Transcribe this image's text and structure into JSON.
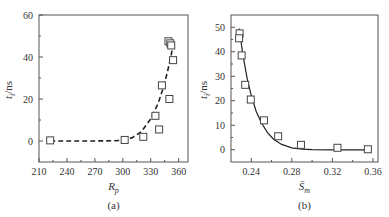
{
  "chart_data": [
    {
      "type": "scatter",
      "panel_label": "(a)",
      "xlabel": "R",
      "xlabel_sub": "p",
      "ylabel": "t",
      "ylabel_sub": "i",
      "ylabel_unit": "/ns",
      "xlim": [
        210,
        370
      ],
      "ylim": [
        -10,
        60
      ],
      "xticks": [
        210,
        240,
        270,
        300,
        330,
        360
      ],
      "yticks": [
        0,
        20,
        40,
        60
      ],
      "grid": false,
      "series": [
        {
          "name": "measured",
          "marker": "open-square",
          "points": [
            [
              222,
              0.3
            ],
            [
              302,
              0.5
            ],
            [
              322,
              2
            ],
            [
              335,
              12
            ],
            [
              339,
              5.5
            ],
            [
              342,
              26.5
            ],
            [
              349,
              47.5
            ],
            [
              350,
              20
            ],
            [
              351,
              46.5
            ],
            [
              352,
              45.5
            ],
            [
              354,
              38.5
            ]
          ]
        },
        {
          "name": "fit",
          "style": "dashed",
          "points": [
            [
              222,
              0
            ],
            [
              260,
              0
            ],
            [
              290,
              0.1
            ],
            [
              300,
              0.4
            ],
            [
              310,
              1.5
            ],
            [
              320,
              4.5
            ],
            [
              330,
              10.5
            ],
            [
              338,
              18
            ],
            [
              344,
              26
            ],
            [
              348,
              33
            ],
            [
              352,
              41
            ],
            [
              354,
              46
            ]
          ]
        }
      ]
    },
    {
      "type": "scatter",
      "panel_label": "(b)",
      "xlabel": "S̄",
      "xlabel_sub": "m",
      "ylabel": "t",
      "ylabel_sub": "i",
      "ylabel_unit": "/ns",
      "xlim": [
        0.22,
        0.365
      ],
      "ylim": [
        -5,
        55
      ],
      "xticks": [
        0.24,
        0.28,
        0.32,
        0.36
      ],
      "yticks": [
        0,
        10,
        20,
        30,
        40,
        50
      ],
      "grid": false,
      "series": [
        {
          "name": "measured",
          "marker": "open-square",
          "points": [
            [
              0.2285,
              47.5
            ],
            [
              0.228,
              45.5
            ],
            [
              0.2305,
              38.5
            ],
            [
              0.234,
              26.5
            ],
            [
              0.2395,
              20.5
            ],
            [
              0.2525,
              12
            ],
            [
              0.2665,
              5.5
            ],
            [
              0.289,
              2
            ],
            [
              0.325,
              0.8
            ],
            [
              0.355,
              0.2
            ]
          ]
        },
        {
          "name": "fit",
          "style": "solid",
          "points": [
            [
              0.228,
              49.5
            ],
            [
              0.232,
              38
            ],
            [
              0.236,
              29
            ],
            [
              0.24,
              22
            ],
            [
              0.245,
              15.5
            ],
            [
              0.25,
              11
            ],
            [
              0.256,
              7
            ],
            [
              0.262,
              4.3
            ],
            [
              0.27,
              2.2
            ],
            [
              0.28,
              0.8
            ],
            [
              0.29,
              0.25
            ],
            [
              0.3,
              0.05
            ],
            [
              0.32,
              0
            ],
            [
              0.356,
              0
            ]
          ]
        }
      ]
    }
  ]
}
